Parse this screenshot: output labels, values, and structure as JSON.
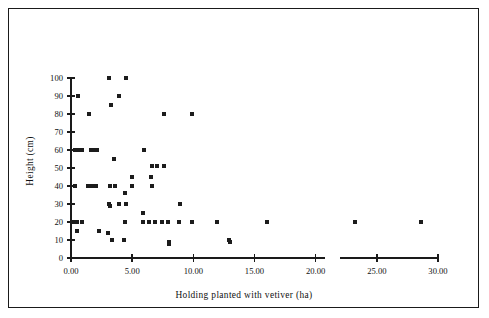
{
  "figure": {
    "border_color": "#1a1a1a",
    "background": "#ffffff"
  },
  "chart_data": {
    "type": "scatter",
    "title": "",
    "subtitle": "",
    "xlabel": "Holding planted with vetiver (ha)",
    "ylabel": "Height (cm)",
    "xlim": [
      0,
      30
    ],
    "ylim": [
      0,
      100
    ],
    "xticks": [
      0,
      5,
      10,
      15,
      20,
      25,
      30
    ],
    "xtick_labels": [
      "0.00",
      "5.00",
      "10.00",
      "15.00",
      "20.00",
      "25.00",
      "30.00"
    ],
    "yticks": [
      0,
      10,
      20,
      30,
      40,
      50,
      60,
      70,
      80,
      90,
      100
    ],
    "ytick_labels": [
      "0",
      "10",
      "20",
      "30",
      "40",
      "50",
      "60",
      "70",
      "80",
      "90",
      "100"
    ],
    "grid": false,
    "legend": null,
    "axis_break": {
      "start": 20.8,
      "end": 22.0,
      "axis": "x"
    },
    "marker": {
      "shape": "square",
      "color": "#1c1c1c",
      "size_px": 4
    },
    "series": [
      {
        "name": "Vetiver plots",
        "points": [
          [
            0.35,
            60
          ],
          [
            0.6,
            60
          ],
          [
            0.9,
            60
          ],
          [
            1.6,
            60
          ],
          [
            1.85,
            60
          ],
          [
            2.1,
            60
          ],
          [
            0.55,
            90
          ],
          [
            1.45,
            80
          ],
          [
            3.1,
            100
          ],
          [
            4.5,
            100
          ],
          [
            3.25,
            85
          ],
          [
            3.9,
            90
          ],
          [
            7.6,
            80
          ],
          [
            9.9,
            80
          ],
          [
            3.5,
            55
          ],
          [
            6.0,
            60
          ],
          [
            6.6,
            51
          ],
          [
            7.0,
            51
          ],
          [
            7.6,
            51
          ],
          [
            0.3,
            40
          ],
          [
            1.35,
            40
          ],
          [
            1.7,
            40
          ],
          [
            2.05,
            40
          ],
          [
            3.15,
            40
          ],
          [
            3.6,
            40
          ],
          [
            5.0,
            45
          ],
          [
            5.0,
            40
          ],
          [
            6.55,
            45
          ],
          [
            6.6,
            40
          ],
          [
            4.4,
            36
          ],
          [
            3.1,
            30
          ],
          [
            3.15,
            29
          ],
          [
            3.9,
            30
          ],
          [
            4.5,
            30
          ],
          [
            8.9,
            30
          ],
          [
            5.9,
            25
          ],
          [
            0.2,
            20
          ],
          [
            0.45,
            20
          ],
          [
            0.9,
            20
          ],
          [
            0.5,
            15
          ],
          [
            2.3,
            15
          ],
          [
            3.0,
            14
          ],
          [
            3.35,
            10
          ],
          [
            4.3,
            10
          ],
          [
            4.4,
            20
          ],
          [
            5.9,
            20
          ],
          [
            6.4,
            20
          ],
          [
            6.9,
            20
          ],
          [
            7.4,
            20
          ],
          [
            7.9,
            20
          ],
          [
            8.85,
            20
          ],
          [
            9.9,
            20
          ],
          [
            11.9,
            20
          ],
          [
            16.0,
            20
          ],
          [
            23.2,
            20
          ],
          [
            28.6,
            20
          ],
          [
            8.0,
            9
          ],
          [
            8.05,
            8
          ],
          [
            12.95,
            10
          ],
          [
            13.0,
            9
          ]
        ]
      }
    ]
  }
}
